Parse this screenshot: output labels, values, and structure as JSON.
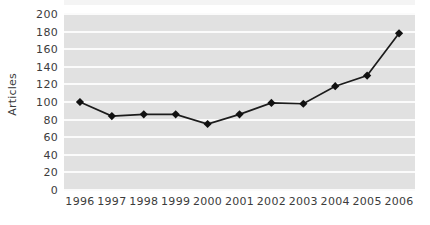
{
  "chart_data": {
    "type": "line",
    "title": "",
    "xlabel": "",
    "ylabel": "Articles",
    "categories": [
      "1996",
      "1997",
      "1998",
      "1999",
      "2000",
      "2001",
      "2002",
      "2003",
      "2004",
      "2005",
      "2006"
    ],
    "values": [
      100,
      84,
      86,
      86,
      75,
      86,
      99,
      98,
      118,
      130,
      178
    ],
    "series": [
      {
        "name": "Articles",
        "values": [
          100,
          84,
          86,
          86,
          75,
          86,
          99,
          98,
          118,
          130,
          178
        ]
      }
    ],
    "ylim": [
      0,
      200
    ],
    "ytick_values": [
      0,
      20,
      40,
      60,
      80,
      100,
      120,
      140,
      160,
      180,
      200
    ],
    "ytick_labels": [
      "0",
      "20",
      "40",
      "60",
      "80",
      "100",
      "120",
      "140",
      "160",
      "180",
      "200"
    ],
    "xtick_labels": [
      "1996",
      "1997",
      "1998",
      "1999",
      "2000",
      "2001",
      "2002",
      "2003",
      "2004",
      "2005",
      "2006"
    ],
    "grid": true,
    "grid_orientation": "horizontal",
    "legend": false,
    "legend_position": "none",
    "marker": "diamond",
    "annotations": []
  },
  "style": {
    "plot_background": "#e1e1e1",
    "gridline_color": "#fbfbfb",
    "line_color": "#1c1c1c",
    "marker_color": "#111111",
    "text_color": "#3c3c3c",
    "page_background": "#ffffff"
  }
}
